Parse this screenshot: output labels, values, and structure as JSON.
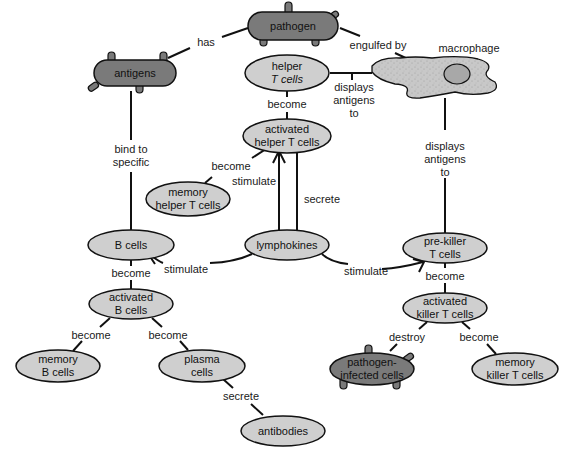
{
  "colors": {
    "light_node": "#cfcfcf",
    "dark_node": "#7a7a7a",
    "macrophage_fill": "#c8c8c8",
    "nucleus_fill": "#a8a8a8",
    "stroke": "#111111",
    "background": "#ffffff"
  },
  "nodes": {
    "pathogen": {
      "line1": "pathogen"
    },
    "antigens": {
      "line1": "antigens"
    },
    "macrophage": {
      "line1": "macrophage"
    },
    "helper_t": {
      "line1": "helper",
      "line2": "T cells"
    },
    "activated_helper_t": {
      "line1": "activated",
      "line2": "helper T cells"
    },
    "memory_helper_t": {
      "line1": "memory",
      "line2": "helper T cells"
    },
    "b_cells": {
      "line1": "B cells"
    },
    "lymphokines": {
      "line1": "lymphokines"
    },
    "pre_killer_t": {
      "line1": "pre-killer",
      "line2": "T cells"
    },
    "activated_b": {
      "line1": "activated",
      "line2": "B cells"
    },
    "activated_killer_t": {
      "line1": "activated",
      "line2": "killer T cells"
    },
    "memory_b": {
      "line1": "memory",
      "line2": "B cells"
    },
    "plasma": {
      "line1": "plasma",
      "line2": "cells"
    },
    "pathogen_infected": {
      "line1": "pathogen-",
      "line2": "infected cells"
    },
    "memory_killer_t": {
      "line1": "memory",
      "line2": "killer T cells"
    },
    "antibodies": {
      "line1": "antibodies"
    }
  },
  "edges": {
    "has": "has",
    "engulfed_by": "engulfed by",
    "displays_helper": {
      "line1": "displays",
      "line2": "antigens",
      "line3": "to"
    },
    "displays_killer": {
      "line1": "displays",
      "line2": "antigens",
      "line3": "to"
    },
    "bind_to": {
      "line1": "bind to",
      "line2": "specific"
    },
    "become_helper": "become",
    "become_memory_helper": "become",
    "stimulate_helper": "stimulate",
    "secrete_lymph": "secrete",
    "stimulate_b": "stimulate",
    "stimulate_killer": "stimulate",
    "become_b": "become",
    "become_killer": "become",
    "become_memory_b": "become",
    "become_plasma": "become",
    "destroy": "destroy",
    "become_memory_killer": "become",
    "secrete_antibodies": "secrete"
  }
}
